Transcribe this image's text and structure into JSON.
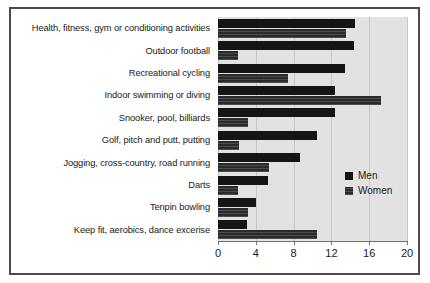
{
  "chart_data": {
    "type": "bar",
    "orientation": "horizontal",
    "title": "",
    "subtitle": "",
    "xlabel": "",
    "ylabel": "",
    "xlim": [
      0,
      20
    ],
    "xticks": [
      0,
      4,
      8,
      12,
      16,
      20
    ],
    "xtick_labels": [
      "0",
      "4",
      "8",
      "12",
      "16",
      "20"
    ],
    "grid": true,
    "grid_axis": "x",
    "legend_position": "center-right",
    "plot_background": "#e2e2e2",
    "categories": [
      "Health, fitness, gym or conditioning activities",
      "Outdoor football",
      "Recreational cycling",
      "Indoor swimming or diving",
      "Snooker, pool, billiards",
      "Golf, pitch and putt, putting",
      "Jogging, cross-country, road running",
      "Darts",
      "Tenpin bowling",
      "Keep fit, aerobics, dance excerise"
    ],
    "series": [
      {
        "name": "Men",
        "color": "#151515",
        "values": [
          14.5,
          14.4,
          13.4,
          12.4,
          12.4,
          10.5,
          8.7,
          5.3,
          4.0,
          3.1
        ]
      },
      {
        "name": "Women",
        "color": "#2a2a2a",
        "values": [
          13.5,
          2.1,
          7.4,
          17.2,
          3.2,
          2.2,
          5.4,
          2.1,
          3.2,
          10.5
        ]
      }
    ]
  },
  "legend": {
    "items": [
      {
        "label": "Men",
        "swatch": "legend-swatch-men"
      },
      {
        "label": "Women",
        "swatch": "legend-swatch-women"
      }
    ]
  },
  "frame": {
    "border_color": "#4a4a4a",
    "background": "#ffffff"
  }
}
